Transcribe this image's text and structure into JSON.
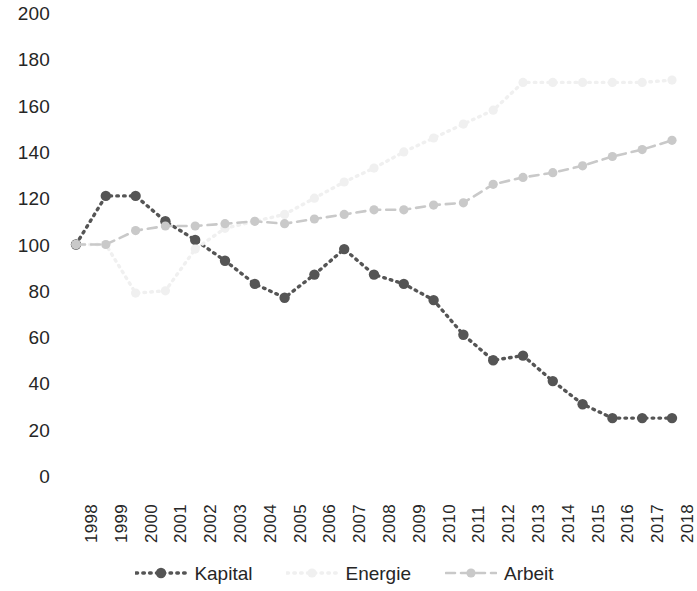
{
  "chart_data": {
    "type": "line",
    "title": "",
    "xlabel": "",
    "ylabel": "",
    "x": [
      1998,
      1999,
      2000,
      2001,
      2002,
      2003,
      2004,
      2005,
      2006,
      2007,
      2008,
      2009,
      2010,
      2011,
      2012,
      2013,
      2014,
      2015,
      2016,
      2017,
      2018
    ],
    "categories": [
      "1998",
      "1999",
      "2000",
      "2001",
      "2002",
      "2003",
      "2004",
      "2005",
      "2006",
      "2007",
      "2008",
      "2009",
      "2010",
      "2011",
      "2012",
      "2013",
      "2014",
      "2015",
      "2016",
      "2017",
      "2018"
    ],
    "ylim": [
      0,
      200
    ],
    "ytick_values": [
      0,
      20,
      40,
      60,
      80,
      100,
      120,
      140,
      160,
      180,
      200
    ],
    "ytick_labels": [
      "0",
      "20",
      "40",
      "60",
      "80",
      "100",
      "120",
      "140",
      "160",
      "180",
      "200"
    ],
    "grid": false,
    "legend_position": "bottom",
    "series": [
      {
        "name": "Kapital",
        "color": "#555555",
        "style": "dotted",
        "marker": "circle",
        "values": [
          100,
          121,
          121,
          110,
          102,
          93,
          83,
          77,
          87,
          98,
          87,
          83,
          76,
          61,
          50,
          52,
          41,
          31,
          25,
          25,
          25
        ]
      },
      {
        "name": "Energie",
        "color": "#f0f0f0",
        "style": "dotted",
        "marker": "circle",
        "values": [
          100,
          100,
          79,
          80,
          98,
          107,
          110,
          113,
          120,
          127,
          133,
          140,
          146,
          152,
          158,
          170,
          170,
          170,
          170,
          170,
          171
        ]
      },
      {
        "name": "Arbeit",
        "color": "#c9c9c9",
        "style": "dashed",
        "marker": "circle",
        "values": [
          100,
          100,
          106,
          108,
          108,
          109,
          110,
          109,
          111,
          113,
          115,
          115,
          117,
          118,
          126,
          129,
          131,
          134,
          138,
          141,
          145
        ]
      }
    ]
  },
  "legend": {
    "items": [
      {
        "label": "Kapital",
        "icon": "dotted-line-marker-icon"
      },
      {
        "label": "Energie",
        "icon": "dotted-line-icon"
      },
      {
        "label": "Arbeit",
        "icon": "dashed-line-marker-icon"
      }
    ]
  }
}
